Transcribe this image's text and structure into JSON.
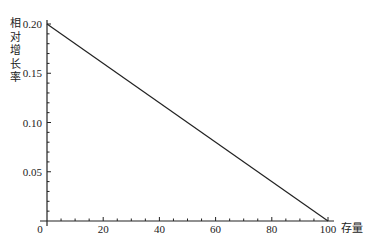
{
  "chart_data": {
    "type": "line",
    "title": "",
    "xlabel": "存量",
    "ylabel": "相对增长率",
    "xlim": [
      0,
      100
    ],
    "ylim": [
      0,
      0.2
    ],
    "x_ticks": [
      0,
      20,
      40,
      60,
      80,
      100
    ],
    "x_tick_labels": [
      "0",
      "20",
      "40",
      "60",
      "80",
      "100"
    ],
    "x_minor_step": 5,
    "y_ticks": [
      0.05,
      0.1,
      0.15,
      0.2
    ],
    "y_tick_labels": [
      "0.05",
      "0.10",
      "0.15",
      "0.20"
    ],
    "y_minor_step": 0.01,
    "grid": false,
    "legend": null,
    "series": [
      {
        "name": "相对增长率",
        "x": [
          0,
          100
        ],
        "values": [
          0.2,
          0.0
        ],
        "color": "#222222"
      }
    ]
  }
}
